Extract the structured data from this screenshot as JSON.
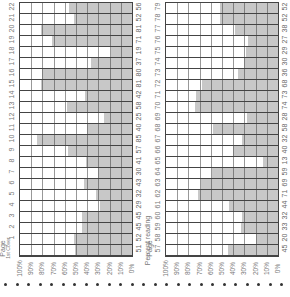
{
  "chart_data": [
    {
      "type": "bar",
      "orientation": "horizontal (page image rotated 90°)",
      "title": "",
      "xlabel": "Page",
      "ylabel": "Percent reading",
      "ylim": [
        0,
        100
      ],
      "y_ticks": [
        "100%",
        "90%",
        "80%",
        "70%",
        "60%",
        "50%",
        "40%",
        "30%",
        "20%",
        "10%",
        "0%"
      ],
      "grid": true,
      "categories": [
        "1st Cover",
        "1",
        "2",
        "3",
        "4",
        "5",
        "6",
        "7",
        "8",
        "9",
        "10",
        "11",
        "12",
        "13",
        "14",
        "15",
        "16",
        "17",
        "18",
        "19",
        "20",
        "21",
        "22"
      ],
      "values": [
        51,
        52,
        45,
        45,
        29,
        32,
        43,
        30,
        41,
        57,
        85,
        40,
        25,
        58,
        42,
        81,
        80,
        37,
        19,
        71,
        81,
        52,
        56
      ]
    },
    {
      "type": "bar",
      "orientation": "horizontal (page image rotated 90°)",
      "title": "",
      "xlabel": "Page",
      "ylabel": "Percent reading",
      "ylim": [
        0,
        100
      ],
      "y_ticks": [
        "100%",
        "90%",
        "80%",
        "70%",
        "60%",
        "50%",
        "40%",
        "30%",
        "20%",
        "10%",
        "0%"
      ],
      "grid": true,
      "categories": [
        "57",
        "58",
        "59",
        "60",
        "61",
        "62",
        "63",
        "64",
        "65",
        "66",
        "67",
        "68",
        "69",
        "70",
        "71",
        "72",
        "73",
        "74",
        "75",
        "76",
        "77",
        "78",
        "79"
      ],
      "values": [
        45,
        20,
        33,
        32,
        44,
        71,
        69,
        59,
        13,
        40,
        32,
        58,
        28,
        74,
        73,
        68,
        36,
        30,
        29,
        27,
        38,
        52,
        52
      ]
    }
  ],
  "labels": {
    "page": "Page",
    "first_cover": "1st Cover",
    "percent_reading": "Percent reading"
  },
  "colors": {
    "bar_fill": "#c8c8c8",
    "grid_line": "#444444",
    "background": "#ffffff"
  }
}
